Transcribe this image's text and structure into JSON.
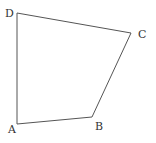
{
  "diagram": {
    "type": "quadrilateral",
    "stroke_color": "#555555",
    "label_color": "#333333",
    "vertices": [
      {
        "name": "A",
        "x": 17,
        "y": 124,
        "label_x": 8,
        "label_y": 133
      },
      {
        "name": "B",
        "x": 92,
        "y": 117,
        "label_x": 95,
        "label_y": 130
      },
      {
        "name": "C",
        "x": 131,
        "y": 33,
        "label_x": 138,
        "label_y": 38
      },
      {
        "name": "D",
        "x": 17,
        "y": 13,
        "label_x": 5,
        "label_y": 17
      }
    ],
    "edges": [
      {
        "from": "A",
        "to": "B"
      },
      {
        "from": "B",
        "to": "C"
      },
      {
        "from": "C",
        "to": "D"
      },
      {
        "from": "D",
        "to": "A"
      }
    ]
  }
}
